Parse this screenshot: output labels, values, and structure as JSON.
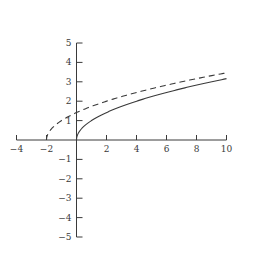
{
  "chart_data": {
    "type": "line",
    "title": "",
    "xlabel": "",
    "ylabel": "",
    "xlim": [
      -4,
      10
    ],
    "ylim": [
      -5,
      5
    ],
    "grid": false,
    "legend": null,
    "x_ticks": [
      -4,
      -2,
      2,
      4,
      6,
      8,
      10
    ],
    "x_tick_labels": [
      "−4",
      "−2",
      "2",
      "4",
      "6",
      "8",
      "10"
    ],
    "y_ticks": [
      -5,
      -4,
      -3,
      -2,
      -1,
      1,
      2,
      3,
      4,
      5
    ],
    "y_tick_labels": [
      "−5",
      "−4",
      "−3",
      "−2",
      "−1",
      "1",
      "2",
      "3",
      "4",
      "5"
    ],
    "series": [
      {
        "name": "y = √x",
        "style": "solid",
        "domain": [
          0,
          10
        ],
        "x": [
          0,
          0.25,
          1,
          2,
          4,
          6,
          8,
          10
        ],
        "values": [
          0,
          0.5,
          1,
          1.41,
          2,
          2.45,
          2.83,
          3.16
        ]
      },
      {
        "name": "y = √(x+2)",
        "style": "dashed",
        "domain": [
          -2,
          10
        ],
        "x": [
          -2,
          -1,
          0,
          2,
          4,
          6,
          8,
          10
        ],
        "values": [
          0,
          1,
          1.41,
          2,
          2.45,
          2.83,
          3.16,
          3.46
        ]
      }
    ]
  },
  "colors": {
    "axis": "#3a3a3a",
    "curve": "#3a3a3a",
    "background": "#ffffff"
  }
}
